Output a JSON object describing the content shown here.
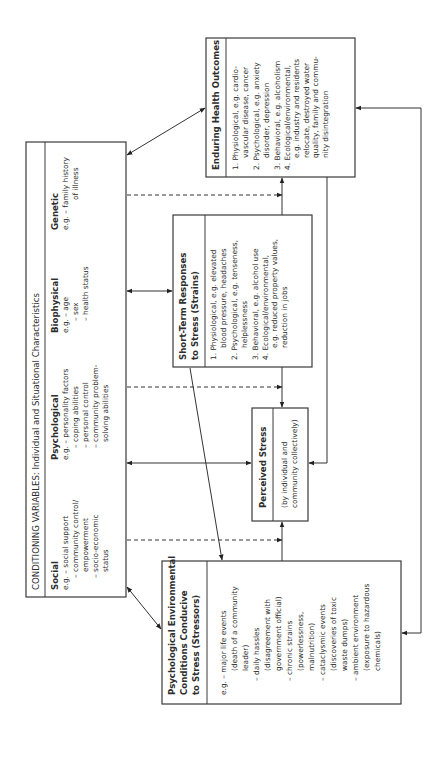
{
  "conditioning": {
    "title": "CONDITIONING VARIABLES: Individual and Situational Characteristics",
    "columns": [
      {
        "heading": "Social",
        "lines": [
          "e.g. – social support",
          "– community control/",
          "empowerment",
          "– socio-economic",
          "status"
        ]
      },
      {
        "heading": "Psychological",
        "lines": [
          "e.g. – personality factors",
          "– coping abilities",
          "– personal control",
          "– community problem-",
          "solving abilities"
        ]
      },
      {
        "heading": "Biophysical",
        "lines": [
          "e.g. – age",
          "– sex",
          "– health status"
        ]
      },
      {
        "heading": "Genetic",
        "lines": [
          "e.g. – family history",
          "of illness"
        ]
      }
    ]
  },
  "stressors": {
    "title_lines": [
      "Psychological Environmental",
      "Conditions Conducive",
      "to Stress (Stressors)"
    ],
    "lines": [
      "e.g. –  major life events",
      "(death of a community",
      "leader)",
      "–  daily hassles",
      "(disagreement with",
      "government official)",
      "–  chronic strains",
      "(powerlessness,",
      "malnutrition)",
      "–  cataclysmic events",
      "(discoveries of toxic",
      "waste dumps)",
      "–  ambient environment",
      "(exposure to hazardous",
      "chemicals)"
    ]
  },
  "perceived": {
    "title": "Perceived Stress",
    "lines": [
      "(by individual and",
      "community collectively)"
    ]
  },
  "short_term": {
    "title_lines": [
      "Short-Term Responses",
      "to Stress (Strains)"
    ],
    "lines": [
      "1.  Physiological, e.g. elevated",
      "blood pressure, headaches",
      "2.  Psychological, e.g. tenseness,",
      "helplessness",
      "3.  Behavioral, e.g. alcohol use",
      "4.  Ecological/environmental,",
      "e.g. reduced property values,",
      "reduction in jobs"
    ]
  },
  "enduring": {
    "title": "Enduring Health Outcomes",
    "lines": [
      "1.  Physiological, e.g. cardio-",
      "vascular disease, cancer",
      "2.  Psychological, e.g. anxiety",
      "disorder, depression",
      "3.  Behavioral, e.g. alcoholism",
      "4.  Ecological/environmental,",
      "e.g. industry and residents",
      "relocate, destroyed water",
      "quality, family and commu-",
      "nity disintegration"
    ]
  }
}
